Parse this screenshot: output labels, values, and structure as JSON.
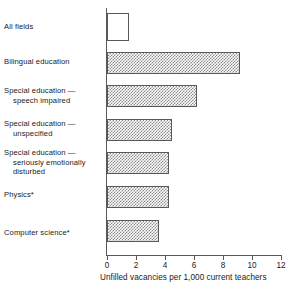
{
  "chart_data": {
    "type": "bar",
    "orientation": "horizontal",
    "title": "",
    "subtitle": "",
    "xlabel": "Unfilled vacancies per 1,000 current teachers",
    "ylabel": "",
    "xlim": [
      0,
      12
    ],
    "xticks": [
      0,
      2,
      4,
      6,
      8,
      10,
      12
    ],
    "xticklabels": [
      "0",
      "2",
      "4",
      "6",
      "8",
      "10",
      "12"
    ],
    "grid": false,
    "legend": null,
    "categories": [
      "All fields",
      "Bilingual education",
      "Special education — speech impaired",
      "Special education — unspecified",
      "Special education — seriously emotionally disturbed",
      "Physics*",
      "Computer science*"
    ],
    "values": [
      1.5,
      9.2,
      6.2,
      4.5,
      4.3,
      4.3,
      3.6
    ],
    "bars": [
      {
        "label_lines": [
          "All fields"
        ],
        "value": 1.5,
        "fill": "open"
      },
      {
        "label_lines": [
          "Bilingual education"
        ],
        "value": 9.2,
        "fill": "hatched"
      },
      {
        "label_lines": [
          "Special education —",
          "speech impaired"
        ],
        "value": 6.2,
        "fill": "hatched"
      },
      {
        "label_lines": [
          "Special education —",
          "unspecified"
        ],
        "value": 4.5,
        "fill": "hatched"
      },
      {
        "label_lines": [
          "Special education —",
          "seriously emotionally",
          "disturbed"
        ],
        "value": 4.3,
        "fill": "hatched"
      },
      {
        "label_lines": [
          "Physics*"
        ],
        "value": 4.3,
        "fill": "hatched"
      },
      {
        "label_lines": [
          "Computer science*"
        ],
        "value": 3.6,
        "fill": "hatched"
      }
    ]
  },
  "colors": {
    "ink": "#1a1a1a",
    "axis": "#58595b",
    "bar_stipple": "#8a8a8a",
    "background": "#ffffff"
  }
}
